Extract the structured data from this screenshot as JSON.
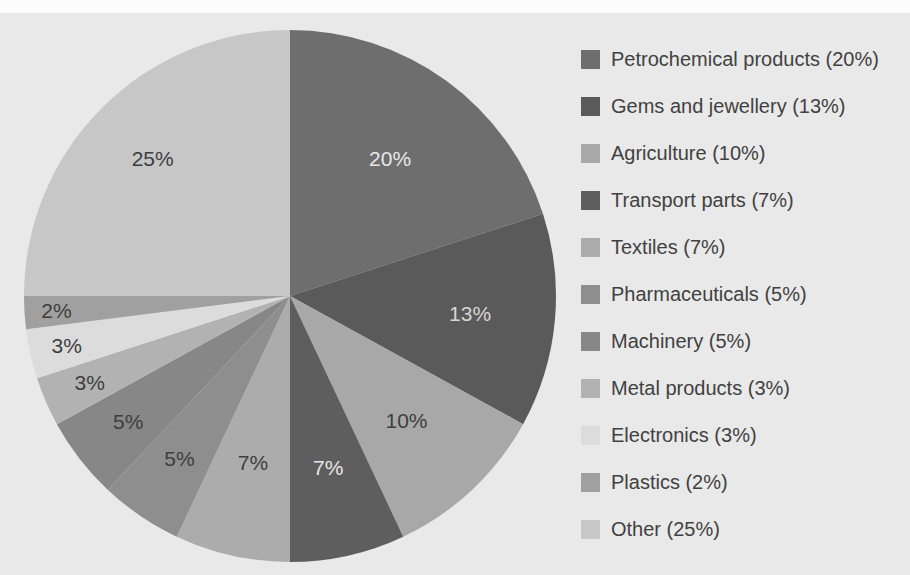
{
  "page": {
    "background_color": "#e9e9e9",
    "top_band_color": "#fcfcfc"
  },
  "chart_data": {
    "type": "pie",
    "title": "",
    "start_angle_deg": 0,
    "direction": "clockwise",
    "legend_position": "right",
    "legend_text_color": "#414141",
    "geometry": {
      "cx": 290,
      "cy": 296,
      "r": 266
    },
    "categories": [
      "Petrochemical products",
      "Gems and jewellery",
      "Agriculture",
      "Transport parts",
      "Textiles",
      "Pharmaceuticals",
      "Machinery",
      "Metal products",
      "Electronics",
      "Plastics",
      "Other"
    ],
    "values": [
      20,
      13,
      10,
      7,
      7,
      5,
      5,
      3,
      3,
      2,
      25
    ],
    "slices": [
      {
        "label": "Petrochemical products",
        "value": 20,
        "display": "20%",
        "legend_label": "Petrochemical products (20%)",
        "color": "#6e6e6e",
        "label_color": "#e7e7e7",
        "label_r": 0.64
      },
      {
        "label": "Gems and jewellery",
        "value": 13,
        "display": "13%",
        "legend_label": "Gems and jewellery (13%)",
        "color": "#5a5a5a",
        "label_color": "#d6d6d6",
        "label_r": 0.68
      },
      {
        "label": "Agriculture",
        "value": 10,
        "display": "10%",
        "legend_label": "Agriculture (10%)",
        "color": "#a8a8a8",
        "label_color": "#3e3e3e",
        "label_r": 0.64
      },
      {
        "label": "Transport parts",
        "value": 7,
        "display": "7%",
        "legend_label": "Transport parts (7%)",
        "color": "#5e5e5e",
        "label_color": "#e7e7e7",
        "label_r": 0.66
      },
      {
        "label": "Textiles",
        "value": 7,
        "display": "7%",
        "legend_label": "Textiles (7%)",
        "color": "#acacac",
        "label_color": "#3e3e3e",
        "label_r": 0.64
      },
      {
        "label": "Pharmaceuticals",
        "value": 5,
        "display": "5%",
        "legend_label": "Pharmaceuticals (5%)",
        "color": "#8e8e8e",
        "label_color": "#3e3e3e",
        "label_r": 0.74
      },
      {
        "label": "Machinery",
        "value": 5,
        "display": "5%",
        "legend_label": "Machinery (5%)",
        "color": "#878787",
        "label_color": "#3e3e3e",
        "label_r": 0.77
      },
      {
        "label": "Metal products",
        "value": 3,
        "display": "3%",
        "legend_label": "Metal products (3%)",
        "color": "#b2b2b2",
        "label_color": "#3e3e3e",
        "label_r": 0.82
      },
      {
        "label": "Electronics",
        "value": 3,
        "display": "3%",
        "legend_label": "Electronics (3%)",
        "color": "#dcdcdc",
        "label_color": "#3e3e3e",
        "label_r": 0.86
      },
      {
        "label": "Plastics",
        "value": 2,
        "display": "2%",
        "legend_label": "Plastics (2%)",
        "color": "#a0a0a0",
        "label_color": "#3e3e3e",
        "label_r": 0.88
      },
      {
        "label": "Other",
        "value": 25,
        "display": "25%",
        "legend_label": "Other (25%)",
        "color": "#c7c7c7",
        "label_color": "#3e3e3e",
        "label_r": 0.73
      }
    ]
  }
}
